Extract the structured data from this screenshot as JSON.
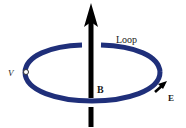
{
  "diagram": {
    "labels": {
      "loop": "Loop",
      "field": "B",
      "emf": "E",
      "voltage": "V"
    },
    "colors": {
      "loop": "#1f2f7a",
      "arrow": "#000000",
      "text": "#1a1a1a"
    }
  }
}
